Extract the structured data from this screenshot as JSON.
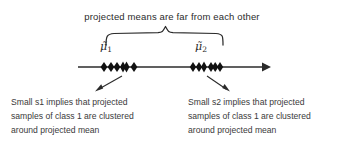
{
  "figure": {
    "headline": "projected means are far from each other",
    "axis": {
      "name": "projection-axis",
      "has_arrowhead": true,
      "direction": "right"
    },
    "means": [
      {
        "id": "mu1",
        "label": "μ̃",
        "subscript": "1"
      },
      {
        "id": "mu2",
        "label": "μ̃",
        "subscript": "2"
      }
    ],
    "clusters": [
      {
        "id": "cluster-1",
        "marker": "diamond",
        "count": 6,
        "positions_px": [
          104,
          111,
          117,
          123,
          126,
          134
        ]
      },
      {
        "id": "cluster-2",
        "marker": "diamond",
        "count": 6,
        "positions_px": [
          193,
          199,
          204,
          211,
          215,
          220
        ]
      }
    ],
    "callouts": [
      {
        "id": "callout-left",
        "lines": [
          "Small  s1  implies  that  projected",
          "samples of class 1 are clustered",
          "around projected mean"
        ]
      },
      {
        "id": "callout-right",
        "lines": [
          "Small  s2  implies  that  projected",
          "samples of class 1 are clustered",
          "around projected mean"
        ]
      }
    ],
    "colors": {
      "background": "#ffffff",
      "ink": "#2b2b2b",
      "text": "#3a3a3a"
    }
  }
}
